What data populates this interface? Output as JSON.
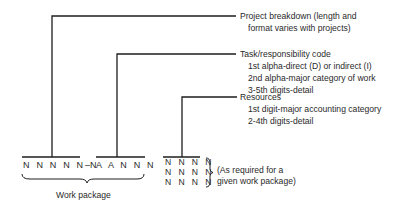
{
  "labels": {
    "project": {
      "line1": "Project breakdown (length and",
      "line2": "format varies with projects)"
    },
    "task": {
      "title": "Task/responsibility code",
      "line1": "1st alpha-direct (D) or indirect (I)",
      "line2": "2nd alpha-major category of work",
      "line3": "3-5th digits-detail"
    },
    "resources": {
      "title": "Resources",
      "line1": "1st digit-major accounting category",
      "line2": "2-4th digits-detail"
    }
  },
  "code": {
    "project_part": "N N N N N N",
    "separator": "–",
    "task_part": "A A N N N",
    "work_package_label": "Work package"
  },
  "resource_grid": {
    "rows": [
      "N N N N",
      "N N N N",
      "N N N N"
    ],
    "note_line1": "(As required for a",
    "note_line2": "given work package)"
  },
  "colors": {
    "line": "#1e1e1e",
    "text": "#2a2a2a",
    "background": "#ffffff"
  }
}
